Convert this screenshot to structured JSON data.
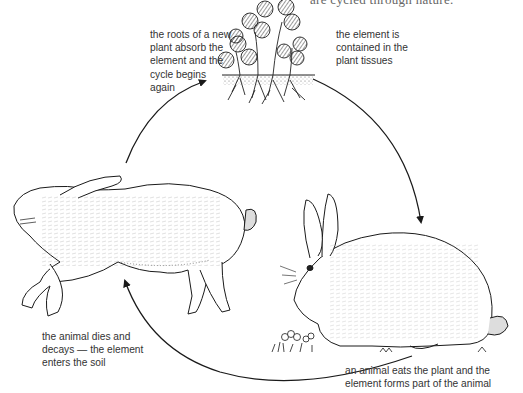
{
  "diagram": {
    "title_fragment": "are cycled through nature.",
    "type": "nutrient-cycle",
    "stages": [
      {
        "id": "plant",
        "label": "the element is\ncontained in the\nplant tissues",
        "illustration": "clover-plants-with-roots"
      },
      {
        "id": "herbivore",
        "label": "an animal eats the plant and the\nelement forms part of the animal",
        "illustration": "live-rabbit-eating"
      },
      {
        "id": "decay",
        "label": "the animal dies and\ndecays — the element\nenters the soil",
        "illustration": "dead-rabbit-lying"
      },
      {
        "id": "uptake",
        "label": "the roots of a new\nplant absorb the\nelement and the\ncycle begins\nagain",
        "illustration": null
      }
    ],
    "arrows": [
      {
        "from": "plant",
        "to": "herbivore",
        "direction": "clockwise"
      },
      {
        "from": "herbivore",
        "to": "decay",
        "direction": "clockwise"
      },
      {
        "from": "decay",
        "to": "plant",
        "direction": "clockwise"
      }
    ],
    "colors": {
      "ink": "#1a1a1a",
      "text": "#333333",
      "background": "#ffffff"
    }
  }
}
